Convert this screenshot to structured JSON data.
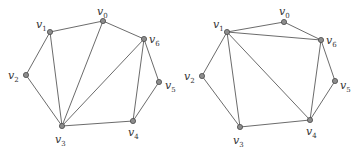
{
  "diagram": {
    "colors": {
      "edge": "#5a5a5a",
      "vertex_fill": "#8c8c8c",
      "vertex_stroke": "#4a4a4a",
      "label": "#333333"
    },
    "graphs": [
      {
        "name": "left-triangulation",
        "vertices": [
          {
            "id": "v0",
            "label": "v",
            "sub": "0",
            "x": 103,
            "y": 21,
            "lx": 97,
            "ly": 15
          },
          {
            "id": "v1",
            "label": "v",
            "sub": "1",
            "x": 50,
            "y": 32,
            "lx": 36,
            "ly": 28
          },
          {
            "id": "v2",
            "label": "v",
            "sub": "2",
            "x": 26,
            "y": 75,
            "lx": 8,
            "ly": 79
          },
          {
            "id": "v3",
            "label": "v",
            "sub": "3",
            "x": 62,
            "y": 126,
            "lx": 55,
            "ly": 143
          },
          {
            "id": "v4",
            "label": "v",
            "sub": "4",
            "x": 133,
            "y": 121,
            "lx": 128,
            "ly": 136
          },
          {
            "id": "v5",
            "label": "v",
            "sub": "5",
            "x": 159,
            "y": 82,
            "lx": 165,
            "ly": 89
          },
          {
            "id": "v6",
            "label": "v",
            "sub": "6",
            "x": 144,
            "y": 39,
            "lx": 149,
            "ly": 43
          }
        ],
        "edges": [
          [
            "v0",
            "v1"
          ],
          [
            "v1",
            "v2"
          ],
          [
            "v2",
            "v3"
          ],
          [
            "v3",
            "v4"
          ],
          [
            "v4",
            "v5"
          ],
          [
            "v5",
            "v6"
          ],
          [
            "v6",
            "v0"
          ],
          [
            "v1",
            "v3"
          ],
          [
            "v0",
            "v3"
          ],
          [
            "v6",
            "v3"
          ],
          [
            "v6",
            "v4"
          ]
        ]
      },
      {
        "name": "right-triangulation",
        "vertices": [
          {
            "id": "v0",
            "label": "v",
            "sub": "0",
            "x": 284,
            "y": 22,
            "lx": 279,
            "ly": 15
          },
          {
            "id": "v1",
            "label": "v",
            "sub": "1",
            "x": 227,
            "y": 32,
            "lx": 213,
            "ly": 28
          },
          {
            "id": "v2",
            "label": "v",
            "sub": "2",
            "x": 202,
            "y": 76,
            "lx": 184,
            "ly": 80
          },
          {
            "id": "v3",
            "label": "v",
            "sub": "3",
            "x": 240,
            "y": 127,
            "lx": 233,
            "ly": 144
          },
          {
            "id": "v4",
            "label": "v",
            "sub": "4",
            "x": 310,
            "y": 120,
            "lx": 306,
            "ly": 135
          },
          {
            "id": "v5",
            "label": "v",
            "sub": "5",
            "x": 335,
            "y": 81,
            "lx": 340,
            "ly": 89
          },
          {
            "id": "v6",
            "label": "v",
            "sub": "6",
            "x": 321,
            "y": 40,
            "lx": 326,
            "ly": 44
          }
        ],
        "edges": [
          [
            "v0",
            "v1"
          ],
          [
            "v1",
            "v2"
          ],
          [
            "v2",
            "v3"
          ],
          [
            "v3",
            "v4"
          ],
          [
            "v4",
            "v5"
          ],
          [
            "v5",
            "v6"
          ],
          [
            "v6",
            "v0"
          ],
          [
            "v1",
            "v6"
          ],
          [
            "v1",
            "v3"
          ],
          [
            "v1",
            "v4"
          ],
          [
            "v6",
            "v4"
          ]
        ]
      }
    ]
  }
}
